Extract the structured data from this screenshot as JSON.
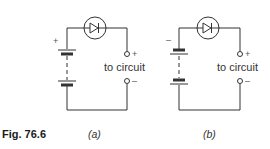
{
  "figure": {
    "label": "Fig. 76.6",
    "panels": [
      {
        "caption": "(a)",
        "battery_sign": "+",
        "terminal_label": "to circuit",
        "terminal_top_sign": "+",
        "terminal_bottom_sign": "–"
      },
      {
        "caption": "(b)",
        "battery_sign": "–",
        "terminal_label": "to circuit",
        "terminal_top_sign": "+",
        "terminal_bottom_sign": "–"
      }
    ]
  },
  "icons": [
    "diode-icon",
    "battery-icon",
    "terminal-icon"
  ]
}
